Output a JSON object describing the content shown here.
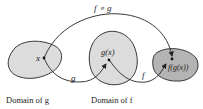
{
  "diagram": {
    "top_arrow_label": "f ∘ g",
    "point_x_label": "x",
    "point_gx_label": "g(x)",
    "point_fgx_label": "f(g(x))",
    "arrow_g_label": "g",
    "arrow_f_label": "f",
    "caption_domain_g": "Domain of g",
    "caption_domain_f": "Domain of f",
    "colors": {
      "domain_g_fill": "#dcdcdc",
      "domain_f_fill": "#dcdcdc",
      "range_fill": "#b4b4b4",
      "stroke": "#222222"
    }
  }
}
